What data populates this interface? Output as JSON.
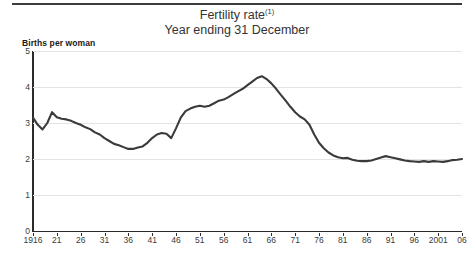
{
  "header": {
    "title": "Fertility rate",
    "title_superscript": "(1)",
    "subtitle": "Year ending 31 December"
  },
  "chart_data": {
    "type": "line",
    "title": "Fertility rate(1)",
    "subtitle": "Year ending 31 December",
    "xlabel": "",
    "ylabel": "Births per woman",
    "ylim": [
      0,
      5
    ],
    "xlim": [
      1916,
      2006
    ],
    "grid": true,
    "legend": null,
    "line_color": "#3a3a3a",
    "yticks": [
      0,
      1,
      2,
      3,
      4,
      5
    ],
    "xticks": [
      1916,
      1921,
      1926,
      1931,
      1936,
      1941,
      1946,
      1951,
      1956,
      1961,
      1966,
      1971,
      1976,
      1981,
      1986,
      1991,
      1996,
      2001,
      2006
    ],
    "xtick_labels": [
      "1916",
      "21",
      "26",
      "31",
      "36",
      "41",
      "46",
      "51",
      "56",
      "61",
      "66",
      "71",
      "76",
      "81",
      "86",
      "91",
      "96",
      "2001",
      "06"
    ],
    "x": [
      1916,
      1917,
      1918,
      1919,
      1920,
      1921,
      1922,
      1923,
      1924,
      1925,
      1926,
      1927,
      1928,
      1929,
      1930,
      1931,
      1932,
      1933,
      1934,
      1935,
      1936,
      1937,
      1938,
      1939,
      1940,
      1941,
      1942,
      1943,
      1944,
      1945,
      1946,
      1947,
      1948,
      1949,
      1950,
      1951,
      1952,
      1953,
      1954,
      1955,
      1956,
      1957,
      1958,
      1959,
      1960,
      1961,
      1962,
      1963,
      1964,
      1965,
      1966,
      1967,
      1968,
      1969,
      1970,
      1971,
      1972,
      1973,
      1974,
      1975,
      1976,
      1977,
      1978,
      1979,
      1980,
      1981,
      1982,
      1983,
      1984,
      1985,
      1986,
      1987,
      1988,
      1989,
      1990,
      1991,
      1992,
      1993,
      1994,
      1995,
      1996,
      1997,
      1998,
      1999,
      2000,
      2001,
      2002,
      2003,
      2004,
      2005,
      2006
    ],
    "values": [
      3.15,
      2.95,
      2.82,
      3.0,
      3.3,
      3.16,
      3.12,
      3.1,
      3.06,
      3.0,
      2.95,
      2.88,
      2.83,
      2.74,
      2.68,
      2.58,
      2.5,
      2.42,
      2.38,
      2.33,
      2.28,
      2.28,
      2.32,
      2.35,
      2.45,
      2.58,
      2.68,
      2.72,
      2.7,
      2.58,
      2.85,
      3.15,
      3.33,
      3.4,
      3.45,
      3.48,
      3.45,
      3.48,
      3.55,
      3.62,
      3.65,
      3.72,
      3.8,
      3.88,
      3.95,
      4.05,
      4.15,
      4.25,
      4.3,
      4.22,
      4.1,
      3.95,
      3.78,
      3.62,
      3.45,
      3.3,
      3.18,
      3.1,
      2.95,
      2.68,
      2.45,
      2.3,
      2.18,
      2.1,
      2.05,
      2.02,
      2.03,
      1.98,
      1.95,
      1.94,
      1.94,
      1.96,
      2.0,
      2.04,
      2.08,
      2.05,
      2.02,
      1.99,
      1.96,
      1.94,
      1.93,
      1.92,
      1.94,
      1.92,
      1.94,
      1.93,
      1.92,
      1.94,
      1.97,
      1.98,
      2.0
    ]
  }
}
